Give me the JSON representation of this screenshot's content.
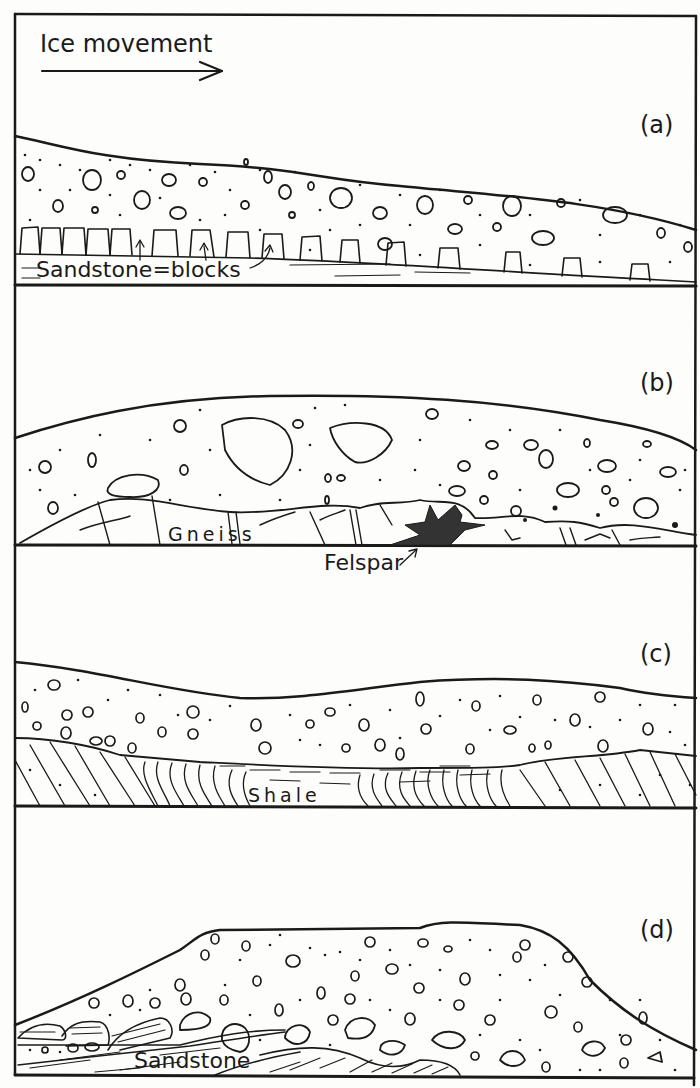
{
  "figure": {
    "title": "Ice movement",
    "direction_arrow": "right-arrow",
    "colors": {
      "ink": "#1a1a1a",
      "paper": "#fdfdfb",
      "felspar_fill": "#333333"
    },
    "panels": [
      {
        "id": "(a)",
        "label": "Sandstone=blocks",
        "description": "Till over sandstone blocks being plucked"
      },
      {
        "id": "(b)",
        "label": "Gneiss",
        "annotation": "Felspar"
      },
      {
        "id": "(c)",
        "label": "Shale"
      },
      {
        "id": "(d)",
        "label": "Sandstone"
      }
    ]
  }
}
